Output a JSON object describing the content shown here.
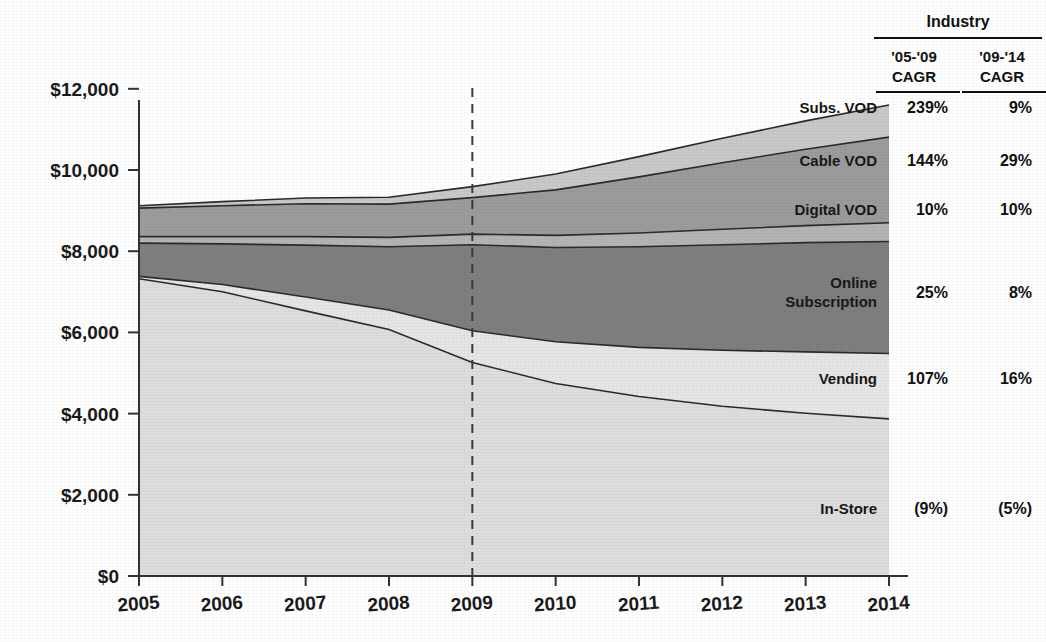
{
  "chart_data": {
    "type": "area",
    "title": "",
    "xlabel": "",
    "ylabel": "",
    "x": [
      2005,
      2006,
      2007,
      2008,
      2009,
      2010,
      2011,
      2012,
      2013,
      2014
    ],
    "xtick_labels": [
      "2005",
      "2006",
      "2007",
      "2008",
      "2009",
      "2010",
      "2011",
      "2012",
      "2013",
      "2014"
    ],
    "ytick_labels": [
      "$0",
      "$2,000",
      "$4,000",
      "$6,000",
      "$8,000",
      "$10,000",
      "$12,000"
    ],
    "ytick_values": [
      0,
      2000,
      4000,
      6000,
      8000,
      10000,
      12000
    ],
    "ylim": [
      0,
      12500
    ],
    "grid": false,
    "legend_position": "inline-right",
    "stacked": true,
    "stack_order_bottom_to_top": [
      "In-Store",
      "Vending",
      "Online Subscription",
      "Digital VOD",
      "Cable VOD",
      "Subs. VOD"
    ],
    "annotation": {
      "vertical_dashed_line_at": 2009
    },
    "series": [
      {
        "name": "In-Store",
        "color": "#dedede",
        "values": [
          7320,
          7000,
          6530,
          6070,
          5260,
          4740,
          4420,
          4180,
          4010,
          3870
        ]
      },
      {
        "name": "Vending",
        "color": "#e6e6e6",
        "values": [
          60,
          180,
          340,
          480,
          780,
          1030,
          1210,
          1380,
          1510,
          1610
        ]
      },
      {
        "name": "Online Subscription",
        "color": "#7f7f7f",
        "values": [
          820,
          1000,
          1280,
          1560,
          2120,
          2320,
          2480,
          2600,
          2690,
          2760
        ]
      },
      {
        "name": "Digital VOD",
        "color": "#b4b4b4",
        "values": [
          160,
          180,
          210,
          230,
          260,
          300,
          340,
          380,
          420,
          460
        ]
      },
      {
        "name": "Cable VOD",
        "color": "#9c9c9c",
        "values": [
          700,
          760,
          810,
          820,
          900,
          1120,
          1380,
          1640,
          1880,
          2110
        ]
      },
      {
        "name": "Subs. VOD",
        "color": "#c9c9c9",
        "values": [
          60,
          100,
          140,
          170,
          270,
          390,
          500,
          600,
          700,
          790
        ]
      }
    ]
  },
  "axis": {
    "y_labels": [
      "$12,000",
      "$10,000",
      "$8,000",
      "$6,000",
      "$4,000",
      "$2,000",
      "$0"
    ],
    "x_labels": [
      "2005",
      "2006",
      "2007",
      "2008",
      "2009",
      "2010",
      "2011",
      "2012",
      "2013",
      "2014"
    ]
  },
  "series_labels": [
    {
      "name": "Subs. VOD",
      "label": "Subs. VOD"
    },
    {
      "name": "Cable VOD",
      "label": "Cable VOD"
    },
    {
      "name": "Digital VOD",
      "label": "Digital VOD"
    },
    {
      "name": "Online Subscription",
      "label_line1": "Online",
      "label_line2": "Subscription"
    },
    {
      "name": "Vending",
      "label": "Vending"
    },
    {
      "name": "In-Store",
      "label": "In-Store"
    }
  ],
  "table": {
    "group_header": "Industry",
    "columns": [
      {
        "line1": "'05-'09",
        "line2": "CAGR"
      },
      {
        "line1": "'09-'14",
        "line2": "CAGR"
      }
    ],
    "rows": [
      {
        "series": "Subs. VOD",
        "cagr_05_09": "239%",
        "cagr_09_14": "9%"
      },
      {
        "series": "Cable VOD",
        "cagr_05_09": "144%",
        "cagr_09_14": "29%"
      },
      {
        "series": "Digital VOD",
        "cagr_05_09": "10%",
        "cagr_09_14": "10%"
      },
      {
        "series": "Online Subscription",
        "cagr_05_09": "25%",
        "cagr_09_14": "8%"
      },
      {
        "series": "Vending",
        "cagr_05_09": "107%",
        "cagr_09_14": "16%"
      },
      {
        "series": "In-Store",
        "cagr_05_09": "(9%)",
        "cagr_09_14": "(5%)"
      }
    ]
  }
}
